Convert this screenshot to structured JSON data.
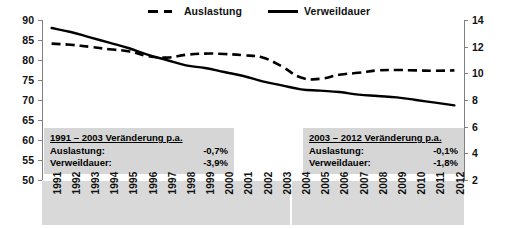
{
  "chart_data": {
    "type": "line",
    "title": "",
    "xlabel": "",
    "ylabel_left": "",
    "ylabel_right": "",
    "grid": false,
    "legend_position": "top-center",
    "x": [
      "1991",
      "1992",
      "1993",
      "1994",
      "1995",
      "1996",
      "1997",
      "1998",
      "1999",
      "2000",
      "2001",
      "2002",
      "2003",
      "2004",
      "2005",
      "2006",
      "2007",
      "2008",
      "2009",
      "2010",
      "2011",
      "2012"
    ],
    "y_left_ticks": [
      50,
      55,
      60,
      65,
      70,
      75,
      80,
      85,
      90
    ],
    "y_left_lim": [
      50,
      90
    ],
    "y_right_ticks": [
      2,
      4,
      6,
      8,
      10,
      12,
      14
    ],
    "y_right_lim": [
      2,
      14
    ],
    "series": [
      {
        "name": "Auslastung",
        "axis": "left",
        "style": "dashed",
        "color": "#000000",
        "values": [
          84.1,
          83.8,
          83.3,
          82.7,
          82.2,
          81.0,
          80.6,
          81.3,
          81.6,
          81.5,
          81.2,
          80.6,
          78.4,
          75.6,
          75.3,
          76.3,
          76.8,
          77.4,
          77.5,
          77.4,
          77.3,
          77.4
        ]
      },
      {
        "name": "Verweildauer",
        "axis": "right",
        "style": "solid",
        "color": "#000000",
        "values": [
          13.4,
          13.1,
          12.7,
          12.3,
          11.9,
          11.4,
          11.0,
          10.6,
          10.4,
          10.1,
          9.8,
          9.4,
          9.1,
          8.8,
          8.7,
          8.6,
          8.4,
          8.3,
          8.2,
          8.0,
          7.8,
          7.6
        ]
      }
    ],
    "annotations": [
      {
        "id": "note-left",
        "title": "1991 – 2003 Veränderung p.a.",
        "rows": [
          {
            "key": "Auslastung:",
            "value": "-0,7%"
          },
          {
            "key": "Verweildauer:",
            "value": "-3,9%"
          }
        ]
      },
      {
        "id": "note-right",
        "title": "2003 – 2012 Veränderung p.a.",
        "rows": [
          {
            "key": "Auslastung:",
            "value": "-0,1%"
          },
          {
            "key": "Verweildauer:",
            "value": "-1,8%"
          }
        ]
      }
    ],
    "colors": {
      "line": "#000000",
      "annotation_background": "#d6d6d6",
      "xaxis_band_background": "#d9d9d9",
      "axis": "#808080",
      "text": "#111111",
      "plot_background": "#ffffff"
    }
  },
  "legend": {
    "items": [
      {
        "label": "Auslastung",
        "style": "dashed"
      },
      {
        "label": "Verweildauer",
        "style": "solid"
      }
    ]
  }
}
